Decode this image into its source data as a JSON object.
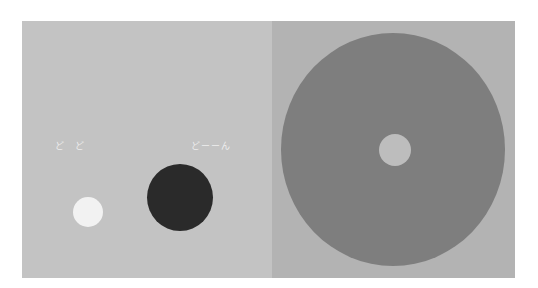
{
  "left_panel": {
    "background": "#c3c3c3",
    "sfx_left": "ど　ど",
    "sfx_right": "どーーん",
    "white_circle": {
      "color": "#f2f2f2"
    },
    "dark_circle": {
      "color": "#2a2a2a"
    }
  },
  "right_panel": {
    "background": "#b3b3b3",
    "big_disc": {
      "color": "#7e7e7e"
    },
    "inner_circle": {
      "color": "#bdbdbd"
    }
  }
}
